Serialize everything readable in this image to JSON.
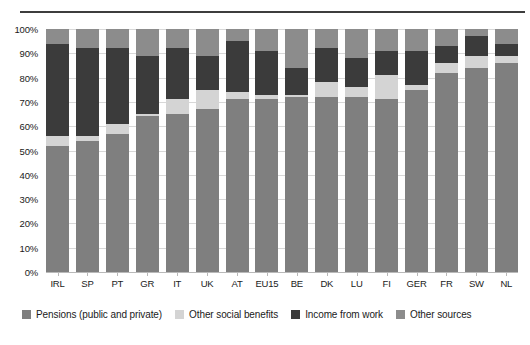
{
  "page": {
    "caption_sliver": "",
    "background": "#ffffff"
  },
  "chart_data": {
    "type": "bar",
    "subtype": "stacked-percentage-column",
    "title": "",
    "subtitle": "",
    "xlabel": "",
    "ylabel": "",
    "ylim": [
      0,
      100
    ],
    "yticks": [
      "0%",
      "10%",
      "20%",
      "30%",
      "40%",
      "50%",
      "60%",
      "70%",
      "80%",
      "90%",
      "100%"
    ],
    "ytick_values": [
      0,
      10,
      20,
      30,
      40,
      50,
      60,
      70,
      80,
      90,
      100
    ],
    "grid": true,
    "grid_axis": "y",
    "legend_position": "bottom-left",
    "categories": [
      "IRL",
      "SP",
      "PT",
      "GR",
      "IT",
      "UK",
      "AT",
      "EU15",
      "BE",
      "DK",
      "LU",
      "FI",
      "GER",
      "FR",
      "SW",
      "NL"
    ],
    "series": [
      {
        "name": "Pensions (public and private)",
        "color": "#7f7f7f",
        "values": [
          52,
          54,
          57,
          64,
          65,
          67,
          71,
          71,
          72,
          72,
          72,
          71,
          75,
          82,
          84,
          86
        ]
      },
      {
        "name": "Other social benefits",
        "color": "#d4d4d4",
        "values": [
          4,
          2,
          4,
          1,
          6,
          8,
          3,
          2,
          1,
          6,
          4,
          10,
          2,
          4,
          5,
          3
        ]
      },
      {
        "name": "Income from work",
        "color": "#3b3b3b",
        "values": [
          38,
          36,
          31,
          24,
          21,
          14,
          21,
          18,
          11,
          14,
          12,
          10,
          14,
          7,
          8,
          5
        ]
      },
      {
        "name": "Other sources",
        "color": "#8c8c8c",
        "values": [
          6,
          8,
          8,
          11,
          8,
          11,
          5,
          9,
          16,
          8,
          12,
          9,
          9,
          7,
          3,
          6
        ]
      }
    ]
  }
}
